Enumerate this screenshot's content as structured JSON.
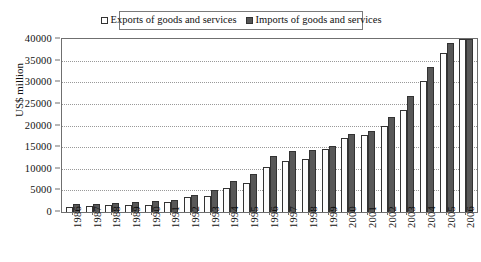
{
  "chart_data": {
    "type": "bar",
    "title": "",
    "xlabel": "",
    "ylabel": "US$ million",
    "ylim": [
      0,
      40000
    ],
    "ytick_step": 5000,
    "yticks": [
      "40000",
      "35000",
      "30000",
      "25000",
      "20000",
      "15000",
      "10000",
      "5000",
      "0"
    ],
    "grid": true,
    "legend_position": "top-center",
    "categories": [
      "1986",
      "1987",
      "1988",
      "1989",
      "1990",
      "1991",
      "1992",
      "1993",
      "1994",
      "1995",
      "1996",
      "1997",
      "1998",
      "1999",
      "2000",
      "2001",
      "2002",
      "2003",
      "2004",
      "2005",
      "2006"
    ],
    "series": [
      {
        "name": "Exports of goods and services",
        "color": "#fdfdfd",
        "values": [
          1250,
          1450,
          1600,
          1600,
          1700,
          2350,
          3500,
          3700,
          5600,
          6800,
          10300,
          11700,
          12200,
          14500,
          17100,
          17900,
          20000,
          23600,
          30200,
          36800,
          40000
        ]
      },
      {
        "name": "Imports of goods and services",
        "color": "#585858",
        "values": [
          1800,
          1950,
          2200,
          2250,
          2450,
          2850,
          3950,
          5000,
          7100,
          8800,
          12950,
          14000,
          14350,
          15300,
          18000,
          18700,
          22000,
          26900,
          33600,
          39100,
          40000
        ]
      }
    ]
  },
  "legend": {
    "entries": [
      {
        "label": "Exports of goods and services",
        "swatch": "hollow-square-icon"
      },
      {
        "label": "Imports of goods and services",
        "swatch": "filled-square-icon"
      }
    ]
  },
  "axes": {
    "y_title": "US$ million"
  }
}
